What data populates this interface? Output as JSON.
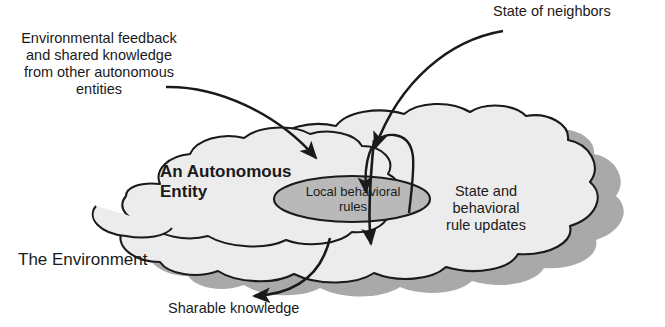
{
  "diagram": {
    "type": "conceptual-diagram",
    "colors": {
      "cloud_fill": "#ececec",
      "cloud_stroke": "#1a1a1a",
      "cloud_shadow": "#a9a9a9",
      "ellipse_fill": "#b9b9b9",
      "ellipse_stroke": "#1a1a1a",
      "arrow": "#1a1a1a",
      "text": "#1a1a1a",
      "background": "#ffffff"
    }
  },
  "labels": {
    "environmental_feedback": "Environmental feedback\nand shared knowledge\nfrom other autonomous\nentities",
    "state_of_neighbors": "State of neighbors",
    "autonomous_entity": "An Autonomous\nEntity",
    "local_behavioral_rules": "Local behavioral\nrules",
    "state_and_rule_updates": "State and\nbehavioral\nrule updates",
    "the_environment": "The Environment",
    "sharable_knowledge": "Sharable knowledge"
  },
  "shapes": {
    "cloud_name": "environment-cloud",
    "entity_cloud_name": "autonomous-entity-cloud",
    "ellipse_name": "local-behavioral-rules-ellipse"
  },
  "arrows": [
    {
      "name": "environmental-feedback-arrow",
      "from": "Environmental feedback label",
      "to": "Autonomous entity cloud",
      "direction": "inward"
    },
    {
      "name": "state-of-neighbors-arrow",
      "from": "State of neighbors label",
      "to": "Autonomous entity cloud",
      "direction": "inward"
    },
    {
      "name": "rule-update-loop-arrow",
      "from": "Local behavioral rules ellipse",
      "to": "Local behavioral rules ellipse",
      "direction": "loop"
    },
    {
      "name": "state-update-down-arrow",
      "from": "Local behavioral rules ellipse",
      "to": "Environment below",
      "direction": "downward"
    },
    {
      "name": "sharable-knowledge-arrow",
      "from": "Autonomous entity",
      "to": "Sharable knowledge label",
      "direction": "outward"
    }
  ]
}
